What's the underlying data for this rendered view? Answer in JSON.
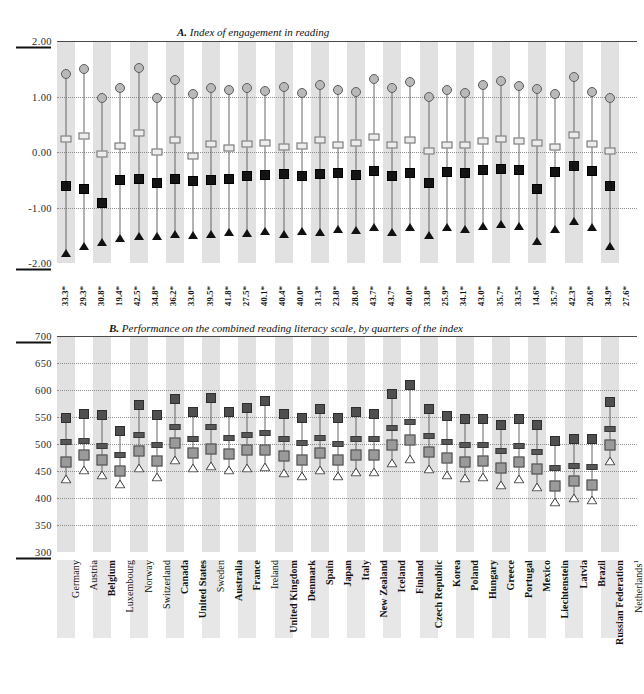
{
  "figure": {
    "panel_a_title_prefix": "A.",
    "panel_a_title": "Index of engagement in reading",
    "panel_b_title_prefix": "B.",
    "panel_b_title": "Performance on the combined reading literacy scale, by quarters of the index"
  },
  "chart_data": {
    "type": "scatter",
    "grid": true,
    "legend_position": "none",
    "panels": [
      {
        "id": "A",
        "title": "Index of engagement in reading",
        "ylabel": "",
        "ylim": [
          -2.0,
          2.0
        ],
        "yticks": [
          "2.00",
          "1.00",
          "0.00",
          "-1.00",
          "-2.00"
        ],
        "ytick_values": [
          2.0,
          1.0,
          0.0,
          -1.0,
          -2.0
        ],
        "marker_series": [
          {
            "name": "Top quarter",
            "marker": "gray-circle"
          },
          {
            "name": "Third quarter",
            "marker": "open-dash"
          },
          {
            "name": "Second quarter",
            "marker": "black-square"
          },
          {
            "name": "Bottom quarter",
            "marker": "black-triangle"
          }
        ],
        "series": [
          {
            "name": "Top quarter",
            "marker": "gray-circle",
            "values": [
              1.4,
              1.5,
              0.97,
              1.16,
              1.52,
              0.98,
              1.3,
              1.05,
              1.16,
              1.12,
              1.15,
              1.1,
              1.18,
              1.06,
              1.2,
              1.11,
              1.08,
              1.32,
              1.15,
              1.27,
              1.0,
              1.12,
              1.06,
              1.2,
              1.28,
              1.19,
              1.14,
              1.05,
              1.35,
              1.09,
              0.98
            ]
          },
          {
            "name": "Third quarter",
            "marker": "open-dash",
            "values": [
              0.24,
              0.28,
              -0.03,
              0.1,
              0.35,
              0.0,
              0.22,
              -0.08,
              0.15,
              0.08,
              0.14,
              0.17,
              0.09,
              0.11,
              0.22,
              0.12,
              0.16,
              0.27,
              0.12,
              0.22,
              0.02,
              0.13,
              0.12,
              0.2,
              0.24,
              0.2,
              0.17,
              0.09,
              0.3,
              0.14,
              0.02
            ]
          },
          {
            "name": "Second quarter",
            "marker": "black-square",
            "values": [
              -0.62,
              -0.66,
              -0.92,
              -0.5,
              -0.48,
              -0.56,
              -0.48,
              -0.52,
              -0.5,
              -0.48,
              -0.44,
              -0.41,
              -0.4,
              -0.43,
              -0.4,
              -0.38,
              -0.41,
              -0.34,
              -0.44,
              -0.37,
              -0.56,
              -0.36,
              -0.38,
              -0.33,
              -0.3,
              -0.32,
              -0.66,
              -0.36,
              -0.25,
              -0.34,
              -0.61
            ]
          },
          {
            "name": "Bottom quarter",
            "marker": "black-triangle",
            "values": [
              -1.82,
              -1.7,
              -1.62,
              -1.55,
              -1.52,
              -1.52,
              -1.48,
              -1.5,
              -1.48,
              -1.45,
              -1.46,
              -1.42,
              -1.48,
              -1.42,
              -1.44,
              -1.38,
              -1.4,
              -1.35,
              -1.44,
              -1.36,
              -1.5,
              -1.36,
              -1.38,
              -1.34,
              -1.3,
              -1.34,
              -1.6,
              -1.38,
              -1.25,
              -1.36,
              -1.7
            ]
          }
        ],
        "percent_labels": [
          "33.3",
          "29.3",
          "30.8",
          "19.4",
          "42.5",
          "34.8",
          "36.2",
          "33.0",
          "39.5",
          "41.8",
          "27.5",
          "40.1",
          "40.4",
          "40.0",
          "31.3",
          "23.8",
          "28.0",
          "43.7",
          "43.7",
          "40.0",
          "33.8",
          "25.9",
          "34.1",
          "43.0",
          "35.7",
          "33.5",
          "14.6",
          "35.7",
          "42.3",
          "20.6",
          "34.9",
          "27.6"
        ],
        "percent_suffix": "*"
      },
      {
        "id": "B",
        "title": "Performance on the combined reading literacy scale, by quarters of the index",
        "ylabel": "",
        "ylim": [
          300,
          700
        ],
        "yticks": [
          "700",
          "650",
          "600",
          "550",
          "500",
          "450",
          "400",
          "350",
          "300"
        ],
        "ytick_values": [
          700,
          650,
          600,
          550,
          500,
          450,
          400,
          350,
          300
        ],
        "series": [
          {
            "name": "Top quarter",
            "marker": "dark-square",
            "values": [
              548,
              556,
              553,
              525,
              572,
              554,
              583,
              559,
              585,
              560,
              567,
              579,
              556,
              549,
              565,
              548,
              560,
              556,
              593,
              609,
              565,
              552,
              546,
              547,
              535,
              546,
              536,
              505,
              509,
              509,
              578
            ]
          },
          {
            "name": "Third quarter",
            "marker": "dash-bar",
            "values": [
              503,
              506,
              497,
              480,
              516,
              498,
              531,
              510,
              531,
              512,
              516,
              520,
              509,
              501,
              512,
              500,
              509,
              509,
              530,
              540,
              515,
              503,
              498,
              498,
              487,
              497,
              485,
              455,
              460,
              458,
              527
            ]
          },
          {
            "name": "Second quarter",
            "marker": "gray-square",
            "values": [
              466,
              479,
              471,
              450,
              487,
              468,
              501,
              484,
              491,
              482,
              488,
              489,
              478,
              470,
              483,
              470,
              479,
              479,
              498,
              507,
              486,
              474,
              467,
              468,
              455,
              466,
              453,
              422,
              432,
              425,
              498
            ]
          },
          {
            "name": "Bottom quarter",
            "marker": "open-triangle",
            "values": [
              436,
              451,
              442,
              426,
              456,
              438,
              470,
              455,
              459,
              451,
              456,
              458,
              447,
              441,
              452,
              440,
              448,
              448,
              465,
              473,
              454,
              443,
              437,
              438,
              424,
              436,
              421,
              392,
              400,
              396,
              468
            ]
          }
        ]
      }
    ],
    "categories": [
      "Germany",
      "Austria",
      "Belgium",
      "Luxembourg",
      "Norway",
      "Switzerland",
      "Canada",
      "United States",
      "Sweden",
      "Australia",
      "France",
      "Ireland",
      "United Kingdom",
      "Denmark",
      "Spain",
      "Japan",
      "Italy",
      "New Zealand",
      "Iceland",
      "Finland",
      "Czech Republic",
      "Korea",
      "Poland",
      "Hungary",
      "Greece",
      "Portugal",
      "Mexico",
      "Liechtenstein",
      "Latvia",
      "Brazil",
      "Russian Federation",
      "Netherlands"
    ]
  },
  "countries": [
    {
      "label": "Germany",
      "bold": false
    },
    {
      "label": "Austria",
      "bold": false
    },
    {
      "label": "Belgium",
      "bold": true
    },
    {
      "label": "Luxembourg",
      "bold": false
    },
    {
      "label": "Norway",
      "bold": false
    },
    {
      "label": "Switzerland",
      "bold": false
    },
    {
      "label": "Canada",
      "bold": true
    },
    {
      "label": "United States",
      "bold": true
    },
    {
      "label": "Sweden",
      "bold": false
    },
    {
      "label": "Australia",
      "bold": true
    },
    {
      "label": "France",
      "bold": true
    },
    {
      "label": "Ireland",
      "bold": false
    },
    {
      "label": "United Kingdom",
      "bold": true
    },
    {
      "label": "Denmark",
      "bold": true
    },
    {
      "label": "Spain",
      "bold": true
    },
    {
      "label": "Japan",
      "bold": true
    },
    {
      "label": "Italy",
      "bold": true
    },
    {
      "label": "New Zealand",
      "bold": true
    },
    {
      "label": "Iceland",
      "bold": true
    },
    {
      "label": "Finland",
      "bold": true
    },
    {
      "label": "Czech Republic",
      "bold": true
    },
    {
      "label": "Korea",
      "bold": true
    },
    {
      "label": "Poland",
      "bold": true
    },
    {
      "label": "Hungary",
      "bold": true
    },
    {
      "label": "Greece",
      "bold": true
    },
    {
      "label": "Portugal",
      "bold": true
    },
    {
      "label": "Mexico",
      "bold": true
    },
    {
      "label": "Liechtenstein",
      "bold": true
    },
    {
      "label": "Latvia",
      "bold": true
    },
    {
      "label": "Brazil",
      "bold": true
    },
    {
      "label": "Russian Federation",
      "bold": true
    },
    {
      "label": "Netherlands",
      "bold": false,
      "footnote": "1"
    }
  ],
  "colors": {
    "band": "#cfcfcf",
    "grid": "#8d8d8d",
    "axis": "#4a4a4a",
    "marker_top_a": "#b9b9b9",
    "marker_black": "#141414",
    "marker_top_b": "#4f4f4f",
    "marker_gray_b": "#9a9a9a",
    "background": "#ffffff"
  }
}
